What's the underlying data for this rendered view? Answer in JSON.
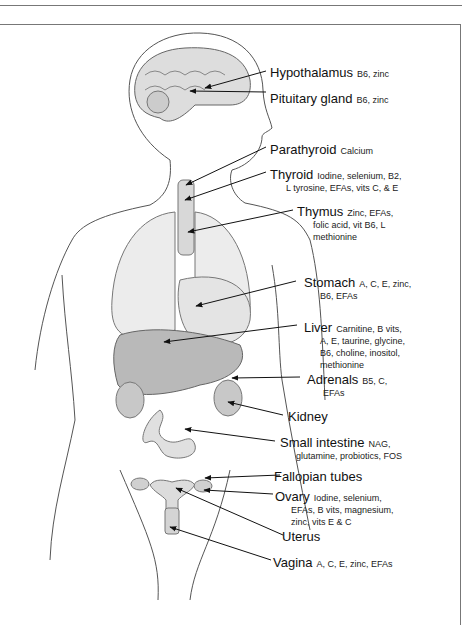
{
  "diagram": {
    "type": "labeled anatomical illustration (female body, endocrine & digestive organs with nutrients)",
    "labels": [
      {
        "id": "hypothalamus",
        "organ": "Hypothalamus",
        "nutrients": [
          "B6, zinc"
        ]
      },
      {
        "id": "pituitary",
        "organ": "Pituitary gland",
        "nutrients": [
          "B6, zinc"
        ]
      },
      {
        "id": "parathyroid",
        "organ": "Parathyroid",
        "nutrients": [
          "Calcium"
        ]
      },
      {
        "id": "thyroid",
        "organ": "Thyroid",
        "nutrients": [
          "Iodine, selenium, B2,",
          "L tyrosine, EFAs, vits C, & E"
        ]
      },
      {
        "id": "thymus",
        "organ": "Thymus",
        "nutrients": [
          "Zinc, EFAs,",
          "folic acid, vit B6, L",
          "methionine"
        ]
      },
      {
        "id": "stomach",
        "organ": "Stomach",
        "nutrients": [
          "A, C, E, zinc,",
          "B6, EFAs"
        ]
      },
      {
        "id": "liver",
        "organ": "Liver",
        "nutrients": [
          "Carnitine, B vits,",
          "A, E, taurine, glycine,",
          "B6, choline, inositol,",
          "methionine"
        ]
      },
      {
        "id": "adrenals",
        "organ": "Adrenals",
        "nutrients": [
          "B5, C,",
          "EFAs"
        ]
      },
      {
        "id": "kidney",
        "organ": "Kidney",
        "nutrients": []
      },
      {
        "id": "small_intestine",
        "organ": "Small intestine",
        "nutrients": [
          "NAG,",
          "glutamine, probiotics, FOS"
        ]
      },
      {
        "id": "fallopian",
        "organ": "Fallopian tubes",
        "nutrients": []
      },
      {
        "id": "ovary",
        "organ": "Ovary",
        "nutrients": [
          "Iodine, selenium,",
          "EFAs, B vits, magnesium,",
          "zinc, vits E & C"
        ]
      },
      {
        "id": "uterus",
        "organ": "Uterus",
        "nutrients": []
      },
      {
        "id": "vagina",
        "organ": "Vagina",
        "nutrients": [
          "A, C, E, zinc, EFAs"
        ]
      }
    ]
  }
}
